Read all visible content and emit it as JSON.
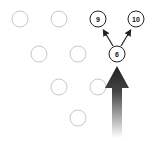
{
  "diagram": {
    "type": "bowling-pin-spare-diagram",
    "pins": [
      {
        "id": "pin-7",
        "label": "",
        "x": 20,
        "y": 19,
        "standing": false
      },
      {
        "id": "pin-8",
        "label": "",
        "x": 59,
        "y": 19,
        "standing": false
      },
      {
        "id": "pin-9",
        "label": "9",
        "x": 98,
        "y": 19,
        "standing": true
      },
      {
        "id": "pin-10",
        "label": "10",
        "x": 136,
        "y": 19,
        "standing": true
      },
      {
        "id": "pin-4",
        "label": "",
        "x": 39,
        "y": 54,
        "standing": false
      },
      {
        "id": "pin-5",
        "label": "",
        "x": 78,
        "y": 54,
        "standing": false
      },
      {
        "id": "pin-6",
        "label": "6",
        "x": 117,
        "y": 54,
        "standing": true
      },
      {
        "id": "pin-2",
        "label": "",
        "x": 59,
        "y": 87,
        "standing": false
      },
      {
        "id": "pin-3",
        "label": "",
        "x": 98,
        "y": 87,
        "standing": false
      },
      {
        "id": "pin-1",
        "label": "",
        "x": 78,
        "y": 118,
        "standing": false
      }
    ],
    "colors": {
      "knocked_pin_stroke": "#c8c8c8",
      "standing_pin_stroke": "#222222",
      "arrow_dark": "#222222",
      "arrow_light": "#ffffff"
    },
    "deflection_arrows": [
      {
        "from": "pin-6",
        "to": "pin-9"
      },
      {
        "from": "pin-6",
        "to": "pin-10"
      }
    ],
    "ball_path_arrow": {
      "x": 117,
      "tip_y": 66,
      "tail_y": 138
    }
  }
}
